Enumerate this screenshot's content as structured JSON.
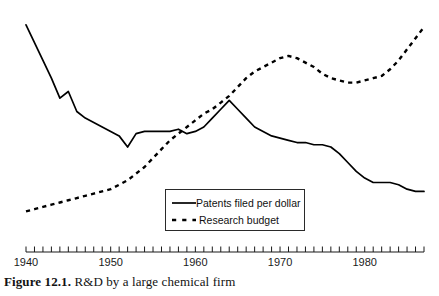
{
  "caption": {
    "figure_number": "Figure 12.1.",
    "text": "R&D by a large chemical firm"
  },
  "legend": {
    "position": "inside-bottom-center",
    "items": [
      {
        "label": "Patents filed per dollar",
        "style": "solid",
        "color": "#000000"
      },
      {
        "label": "Research budget",
        "style": "dashed",
        "color": "#000000"
      }
    ]
  },
  "axis": {
    "x_ticks_major": [
      "1940",
      "1950",
      "1960",
      "1970",
      "1980"
    ],
    "x_minor_tick_interval_years": 1,
    "x_range": [
      1940,
      1987
    ],
    "y_axis_visible": false,
    "grid": false
  },
  "chart_data": {
    "type": "line",
    "title": "R&D by a large chemical firm",
    "xlabel": "",
    "ylabel": "",
    "xlim": [
      1940,
      1987
    ],
    "ylim": [
      0,
      100
    ],
    "grid": false,
    "legend_position": "inside-bottom-center",
    "x": [
      1940,
      1941,
      1942,
      1943,
      1944,
      1945,
      1946,
      1947,
      1948,
      1949,
      1950,
      1951,
      1952,
      1953,
      1954,
      1955,
      1956,
      1957,
      1958,
      1959,
      1960,
      1961,
      1962,
      1963,
      1964,
      1965,
      1966,
      1967,
      1968,
      1969,
      1970,
      1971,
      1972,
      1973,
      1974,
      1975,
      1976,
      1977,
      1978,
      1979,
      1980,
      1981,
      1982,
      1983,
      1984,
      1985,
      1986,
      1987
    ],
    "series": [
      {
        "name": "Patents filed per dollar",
        "style": "solid",
        "color": "#000000",
        "values": [
          96,
          88,
          80,
          72,
          63,
          66,
          57,
          54,
          52,
          50,
          48,
          46,
          41,
          47,
          48,
          48,
          48,
          48,
          49,
          47,
          48,
          50,
          54,
          58,
          62,
          58,
          54,
          50,
          48,
          46,
          45,
          44,
          43,
          43,
          42,
          42,
          41,
          38,
          34,
          30,
          27,
          25,
          25,
          25,
          24,
          22,
          21,
          21
        ]
      },
      {
        "name": "Research budget",
        "style": "dashed",
        "color": "#000000",
        "values": [
          12,
          13,
          14,
          15,
          16,
          17,
          18,
          19,
          20,
          21,
          22,
          24,
          26,
          29,
          32,
          36,
          40,
          44,
          47,
          50,
          53,
          56,
          58,
          61,
          64,
          68,
          72,
          75,
          77,
          79,
          81,
          82,
          81,
          79,
          77,
          74,
          72,
          71,
          70,
          70,
          71,
          72,
          73,
          76,
          80,
          85,
          90,
          95
        ]
      }
    ]
  }
}
